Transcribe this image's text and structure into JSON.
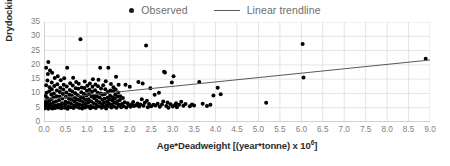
{
  "chart_data": {
    "type": "scatter",
    "title": "",
    "xlabel": "Age*Deadweight [(year*tonne) x 10",
    "xlabel_sup": "6",
    "xlabel_tail": "]",
    "ylabel": "Drydocking time (day)",
    "xlim": [
      0,
      9
    ],
    "ylim": [
      0,
      35
    ],
    "xticks": [
      "0.0",
      "0.5",
      "1.0",
      "1.5",
      "2.0",
      "2.5",
      "3.0",
      "3.5",
      "4.0",
      "4.5",
      "5.0",
      "5.5",
      "6.0",
      "6.5",
      "7.0",
      "7.5",
      "8.0",
      "8.5",
      "9.0"
    ],
    "xtick_values": [
      0,
      0.5,
      1.0,
      1.5,
      2.0,
      2.5,
      3.0,
      3.5,
      4.0,
      4.5,
      5.0,
      5.5,
      6.0,
      6.5,
      7.0,
      7.5,
      8.0,
      8.5,
      9.0
    ],
    "yticks": [
      "0",
      "5",
      "10",
      "15",
      "20",
      "25",
      "30",
      "35"
    ],
    "ytick_values": [
      0,
      5,
      10,
      15,
      20,
      25,
      30,
      35
    ],
    "grid": true,
    "grid_color": "#d9d9d9",
    "marker_color": "#000000",
    "trendline_color": "#595959",
    "legend_position": "top-center",
    "legend": [
      {
        "name": "Observed",
        "marker": "dot"
      },
      {
        "name": "Linear trendline",
        "marker": "line"
      }
    ],
    "series": [
      {
        "name": "Observed",
        "points": [
          [
            0.02,
            4.8
          ],
          [
            0.03,
            5.2
          ],
          [
            0.03,
            6.1
          ],
          [
            0.04,
            7.0
          ],
          [
            0.04,
            9.1
          ],
          [
            0.05,
            12.9
          ],
          [
            0.05,
            19.0
          ],
          [
            0.06,
            10.2
          ],
          [
            0.06,
            5.5
          ],
          [
            0.07,
            6.8
          ],
          [
            0.08,
            8.3
          ],
          [
            0.08,
            14.5
          ],
          [
            0.09,
            16.8
          ],
          [
            0.1,
            21.0
          ],
          [
            0.1,
            4.6
          ],
          [
            0.11,
            5.9
          ],
          [
            0.12,
            7.4
          ],
          [
            0.12,
            10.8
          ],
          [
            0.13,
            12.2
          ],
          [
            0.14,
            18.0
          ],
          [
            0.15,
            5.0
          ],
          [
            0.15,
            6.3
          ],
          [
            0.16,
            8.0
          ],
          [
            0.17,
            9.6
          ],
          [
            0.18,
            11.5
          ],
          [
            0.18,
            13.8
          ],
          [
            0.19,
            17.2
          ],
          [
            0.2,
            4.7
          ],
          [
            0.21,
            5.6
          ],
          [
            0.22,
            6.9
          ],
          [
            0.22,
            8.6
          ],
          [
            0.23,
            10.0
          ],
          [
            0.24,
            12.6
          ],
          [
            0.25,
            15.4
          ],
          [
            0.26,
            4.9
          ],
          [
            0.27,
            5.8
          ],
          [
            0.28,
            7.2
          ],
          [
            0.29,
            9.0
          ],
          [
            0.3,
            11.0
          ],
          [
            0.31,
            13.2
          ],
          [
            0.32,
            16.0
          ],
          [
            0.33,
            5.1
          ],
          [
            0.34,
            6.0
          ],
          [
            0.35,
            7.6
          ],
          [
            0.36,
            8.9
          ],
          [
            0.37,
            10.5
          ],
          [
            0.38,
            12.0
          ],
          [
            0.39,
            14.6
          ],
          [
            0.4,
            4.8
          ],
          [
            0.41,
            5.7
          ],
          [
            0.42,
            6.6
          ],
          [
            0.43,
            8.2
          ],
          [
            0.44,
            9.8
          ],
          [
            0.45,
            11.4
          ],
          [
            0.46,
            13.0
          ],
          [
            0.47,
            15.3
          ],
          [
            0.48,
            5.0
          ],
          [
            0.49,
            6.2
          ],
          [
            0.5,
            7.1
          ],
          [
            0.51,
            8.8
          ],
          [
            0.52,
            10.3
          ],
          [
            0.53,
            12.4
          ],
          [
            0.54,
            19.0
          ],
          [
            0.55,
            4.6
          ],
          [
            0.56,
            5.4
          ],
          [
            0.57,
            6.7
          ],
          [
            0.58,
            8.1
          ],
          [
            0.59,
            9.5
          ],
          [
            0.6,
            11.2
          ],
          [
            0.61,
            13.6
          ],
          [
            0.62,
            5.2
          ],
          [
            0.63,
            6.4
          ],
          [
            0.64,
            7.8
          ],
          [
            0.65,
            9.2
          ],
          [
            0.66,
            10.7
          ],
          [
            0.67,
            12.8
          ],
          [
            0.68,
            15.5
          ],
          [
            0.69,
            4.9
          ],
          [
            0.7,
            5.9
          ],
          [
            0.71,
            7.3
          ],
          [
            0.72,
            8.5
          ],
          [
            0.73,
            10.1
          ],
          [
            0.74,
            11.8
          ],
          [
            0.75,
            14.0
          ],
          [
            0.76,
            5.3
          ],
          [
            0.77,
            6.5
          ],
          [
            0.78,
            7.9
          ],
          [
            0.79,
            9.4
          ],
          [
            0.8,
            11.6
          ],
          [
            0.81,
            13.4
          ],
          [
            0.82,
            5.0
          ],
          [
            0.83,
            6.1
          ],
          [
            0.84,
            7.5
          ],
          [
            0.85,
            29.0
          ],
          [
            0.86,
            8.7
          ],
          [
            0.87,
            10.4
          ],
          [
            0.88,
            12.1
          ],
          [
            0.89,
            4.7
          ],
          [
            0.9,
            5.8
          ],
          [
            0.91,
            7.0
          ],
          [
            0.92,
            8.4
          ],
          [
            0.93,
            9.9
          ],
          [
            0.94,
            11.9
          ],
          [
            0.95,
            14.2
          ],
          [
            0.96,
            5.1
          ],
          [
            0.97,
            6.3
          ],
          [
            0.98,
            7.7
          ],
          [
            0.99,
            9.3
          ],
          [
            1.0,
            10.9
          ],
          [
            1.01,
            12.7
          ],
          [
            1.02,
            5.4
          ],
          [
            1.03,
            6.8
          ],
          [
            1.04,
            8.0
          ],
          [
            1.05,
            9.7
          ],
          [
            1.06,
            11.3
          ],
          [
            1.07,
            13.5
          ],
          [
            1.08,
            4.8
          ],
          [
            1.09,
            5.6
          ],
          [
            1.1,
            7.2
          ],
          [
            1.11,
            8.9
          ],
          [
            1.12,
            10.6
          ],
          [
            1.13,
            12.3
          ],
          [
            1.14,
            15.0
          ],
          [
            1.15,
            5.2
          ],
          [
            1.16,
            6.6
          ],
          [
            1.17,
            8.3
          ],
          [
            1.18,
            9.1
          ],
          [
            1.19,
            11.1
          ],
          [
            1.2,
            13.1
          ],
          [
            1.21,
            4.9
          ],
          [
            1.22,
            6.0
          ],
          [
            1.23,
            7.4
          ],
          [
            1.24,
            8.8
          ],
          [
            1.25,
            10.2
          ],
          [
            1.26,
            12.5
          ],
          [
            1.27,
            14.8
          ],
          [
            1.28,
            5.5
          ],
          [
            1.29,
            6.9
          ],
          [
            1.3,
            8.6
          ],
          [
            1.31,
            19.0
          ],
          [
            1.32,
            10.0
          ],
          [
            1.33,
            11.7
          ],
          [
            1.34,
            5.0
          ],
          [
            1.35,
            6.2
          ],
          [
            1.36,
            7.8
          ],
          [
            1.37,
            9.6
          ],
          [
            1.38,
            12.9
          ],
          [
            1.39,
            5.3
          ],
          [
            1.4,
            6.7
          ],
          [
            1.41,
            8.1
          ],
          [
            1.42,
            9.8
          ],
          [
            1.43,
            11.5
          ],
          [
            1.44,
            14.3
          ],
          [
            1.45,
            4.7
          ],
          [
            1.46,
            5.9
          ],
          [
            1.47,
            7.1
          ],
          [
            1.48,
            8.5
          ],
          [
            1.49,
            10.5
          ],
          [
            1.5,
            19.0
          ],
          [
            1.51,
            5.6
          ],
          [
            1.52,
            6.4
          ],
          [
            1.53,
            7.9
          ],
          [
            1.54,
            9.2
          ],
          [
            1.55,
            11.0
          ],
          [
            1.56,
            13.3
          ],
          [
            1.57,
            5.1
          ],
          [
            1.58,
            6.1
          ],
          [
            1.59,
            7.6
          ],
          [
            1.6,
            8.7
          ],
          [
            1.61,
            10.8
          ],
          [
            1.62,
            12.2
          ],
          [
            1.63,
            5.4
          ],
          [
            1.64,
            6.8
          ],
          [
            1.65,
            8.2
          ],
          [
            1.66,
            9.5
          ],
          [
            1.67,
            11.4
          ],
          [
            1.68,
            15.8
          ],
          [
            1.69,
            5.0
          ],
          [
            1.7,
            6.5
          ],
          [
            1.71,
            7.3
          ],
          [
            1.72,
            8.9
          ],
          [
            1.73,
            10.3
          ],
          [
            1.74,
            13.0
          ],
          [
            1.75,
            5.7
          ],
          [
            1.76,
            6.0
          ],
          [
            1.77,
            7.7
          ],
          [
            1.78,
            9.0
          ],
          [
            1.8,
            5.2
          ],
          [
            1.82,
            6.3
          ],
          [
            1.84,
            8.4
          ],
          [
            1.86,
            5.5
          ],
          [
            1.88,
            6.9
          ],
          [
            1.9,
            13.0
          ],
          [
            1.92,
            5.1
          ],
          [
            1.95,
            6.6
          ],
          [
            1.98,
            5.8
          ],
          [
            2.0,
            12.3
          ],
          [
            2.02,
            5.3
          ],
          [
            2.05,
            6.2
          ],
          [
            2.08,
            7.0
          ],
          [
            2.1,
            5.6
          ],
          [
            2.15,
            5.9
          ],
          [
            2.18,
            6.5
          ],
          [
            2.2,
            14.0
          ],
          [
            2.22,
            5.4
          ],
          [
            2.25,
            6.1
          ],
          [
            2.28,
            8.0
          ],
          [
            2.3,
            13.5
          ],
          [
            2.32,
            5.7
          ],
          [
            2.35,
            6.7
          ],
          [
            2.38,
            26.8
          ],
          [
            2.4,
            7.4
          ],
          [
            2.42,
            5.2
          ],
          [
            2.45,
            6.3
          ],
          [
            2.48,
            11.8
          ],
          [
            2.5,
            5.5
          ],
          [
            2.55,
            6.0
          ],
          [
            2.58,
            9.5
          ],
          [
            2.6,
            5.8
          ],
          [
            2.65,
            6.4
          ],
          [
            2.68,
            10.2
          ],
          [
            2.7,
            5.3
          ],
          [
            2.75,
            6.1
          ],
          [
            2.78,
            7.2
          ],
          [
            2.8,
            17.6
          ],
          [
            2.82,
            17.3
          ],
          [
            2.85,
            5.6
          ],
          [
            2.88,
            6.8
          ],
          [
            2.9,
            5.0
          ],
          [
            2.95,
            6.2
          ],
          [
            2.98,
            13.8
          ],
          [
            3.0,
            5.4
          ],
          [
            3.02,
            16.0
          ],
          [
            3.05,
            5.9
          ],
          [
            3.08,
            6.6
          ],
          [
            3.1,
            5.2
          ],
          [
            3.15,
            6.0
          ],
          [
            3.2,
            7.1
          ],
          [
            3.25,
            5.7
          ],
          [
            3.3,
            6.3
          ],
          [
            3.4,
            5.5
          ],
          [
            3.45,
            6.1
          ],
          [
            3.5,
            5.8
          ],
          [
            3.62,
            14.0
          ],
          [
            3.7,
            6.4
          ],
          [
            3.8,
            5.6
          ],
          [
            3.88,
            6.0
          ],
          [
            3.95,
            9.3
          ],
          [
            4.05,
            12.0
          ],
          [
            4.12,
            9.7
          ],
          [
            5.18,
            6.7
          ],
          [
            6.03,
            27.3
          ],
          [
            6.05,
            15.6
          ],
          [
            8.9,
            22.1
          ]
        ]
      }
    ],
    "trendline": {
      "name": "Linear trendline",
      "x_start": 0.0,
      "y_start": 7.9,
      "x_end": 9.0,
      "y_end": 21.7
    }
  }
}
